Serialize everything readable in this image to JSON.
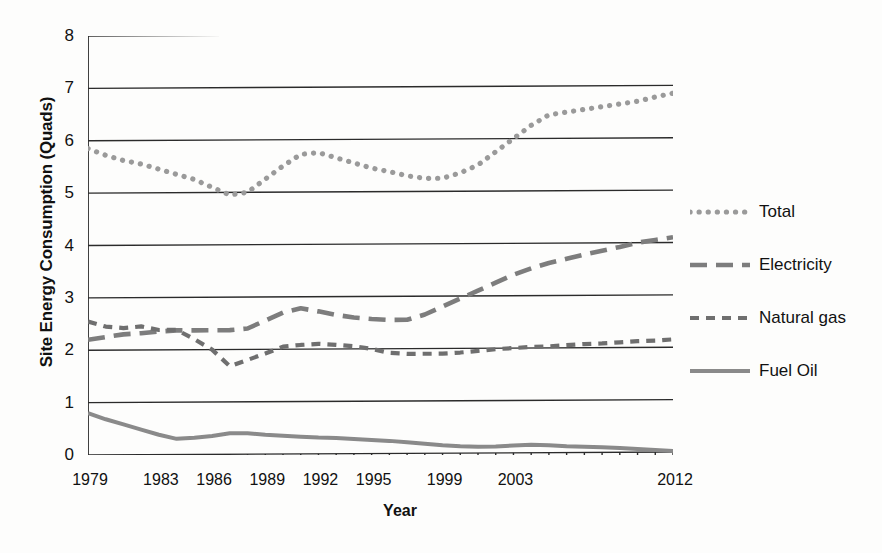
{
  "chart_data": {
    "type": "line",
    "title": "",
    "xlabel": "Year",
    "ylabel": "Site Energy Consumption (Quads)",
    "xlim": [
      1979,
      2012
    ],
    "ylim": [
      0,
      8
    ],
    "ytick_labels": [
      "0",
      "1",
      "2",
      "3",
      "4",
      "5",
      "6",
      "7",
      "8"
    ],
    "ytick_values": [
      0,
      1,
      2,
      3,
      4,
      5,
      6,
      7,
      8
    ],
    "xtick_labels": [
      "1979",
      "1983",
      "1986",
      "1989",
      "1992",
      "1995",
      "1999",
      "2003",
      "2012"
    ],
    "xtick_values": [
      1979,
      1983,
      1986,
      1989,
      1992,
      1995,
      1999,
      2003,
      2012
    ],
    "grid": "horizontal",
    "legend_position": "right",
    "x": [
      1979,
      1980,
      1981,
      1982,
      1983,
      1984,
      1985,
      1986,
      1987,
      1988,
      1989,
      1990,
      1991,
      1992,
      1993,
      1994,
      1995,
      1996,
      1997,
      1998,
      1999,
      2000,
      2001,
      2002,
      2003,
      2004,
      2005,
      2006,
      2007,
      2008,
      2009,
      2010,
      2011,
      2012
    ],
    "series": [
      {
        "name": "Total",
        "style": "dotted",
        "color": "#9a9a9a",
        "values": [
          5.85,
          5.72,
          5.62,
          5.55,
          5.45,
          5.35,
          5.25,
          5.1,
          4.95,
          5.0,
          5.25,
          5.5,
          5.72,
          5.75,
          5.65,
          5.55,
          5.45,
          5.38,
          5.3,
          5.25,
          5.25,
          5.35,
          5.5,
          5.75,
          6.0,
          6.25,
          6.45,
          6.5,
          6.55,
          6.6,
          6.65,
          6.7,
          6.78,
          6.85
        ]
      },
      {
        "name": "Electricity",
        "style": "long-dash",
        "color": "#7d7d7d",
        "values": [
          2.2,
          2.25,
          2.3,
          2.32,
          2.35,
          2.37,
          2.37,
          2.37,
          2.37,
          2.4,
          2.55,
          2.7,
          2.78,
          2.72,
          2.65,
          2.6,
          2.57,
          2.55,
          2.55,
          2.65,
          2.8,
          2.95,
          3.1,
          3.25,
          3.4,
          3.52,
          3.62,
          3.7,
          3.78,
          3.85,
          3.92,
          4.0,
          4.05,
          4.1
        ]
      },
      {
        "name": "Natural gas",
        "style": "short-dash",
        "color": "#6f6f6f",
        "values": [
          2.55,
          2.45,
          2.42,
          2.45,
          2.38,
          2.38,
          2.2,
          2.0,
          1.68,
          1.8,
          1.92,
          2.05,
          2.08,
          2.1,
          2.08,
          2.05,
          2.0,
          1.92,
          1.9,
          1.9,
          1.9,
          1.92,
          1.95,
          1.98,
          2.0,
          2.02,
          2.03,
          2.05,
          2.07,
          2.08,
          2.1,
          2.12,
          2.13,
          2.15
        ]
      },
      {
        "name": "Fuel Oil",
        "style": "solid",
        "color": "#8a8a8a",
        "values": [
          0.8,
          0.68,
          0.58,
          0.48,
          0.38,
          0.3,
          0.32,
          0.35,
          0.4,
          0.4,
          0.37,
          0.35,
          0.33,
          0.31,
          0.3,
          0.28,
          0.26,
          0.24,
          0.21,
          0.18,
          0.15,
          0.13,
          0.12,
          0.12,
          0.14,
          0.15,
          0.14,
          0.12,
          0.11,
          0.1,
          0.08,
          0.06,
          0.04,
          0.02
        ]
      }
    ]
  },
  "axes": {
    "y_title": "Site Energy Consumption (Quads)",
    "x_title": "Year"
  },
  "legend": {
    "entries": [
      {
        "label": "Total"
      },
      {
        "label": "Electricity"
      },
      {
        "label": "Natural gas"
      },
      {
        "label": "Fuel Oil"
      }
    ]
  }
}
